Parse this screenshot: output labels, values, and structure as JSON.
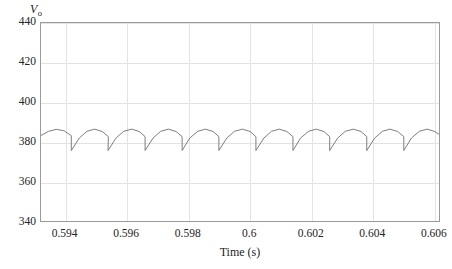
{
  "chart_data": {
    "type": "line",
    "title": "",
    "subtitle": "",
    "xlabel": "Time (s)",
    "ylabel": "V",
    "ylabel_subscript": "o",
    "ylabel_full": "Vo",
    "xlim": [
      0.5932,
      0.6062
    ],
    "ylim": [
      340,
      440
    ],
    "xticks": [
      0.594,
      0.596,
      0.598,
      0.6,
      0.602,
      0.604,
      0.606
    ],
    "xtick_labels": [
      "0.594",
      "0.596",
      "0.598",
      "0.6",
      "0.602",
      "0.604",
      "0.606"
    ],
    "yticks": [
      340,
      360,
      380,
      400,
      420,
      440
    ],
    "ytick_labels": [
      "340",
      "360",
      "380",
      "400",
      "420",
      "440"
    ],
    "grid": true,
    "legend": null,
    "annotations": [],
    "series": [
      {
        "name": "Vo",
        "color": "#6f6f6f",
        "linewidth": 0.9,
        "description": "Rectifier output voltage ripple: repeating arch-shaped cycles with sharp drop at end of each cycle",
        "ripple_period": 0.001206,
        "ripple_peak": 386.4,
        "ripple_trough": 375.6,
        "cycle_count": 11,
        "first_trough_x": 0.59419,
        "x": [
          0.5932,
          0.59345,
          0.5937,
          0.59395,
          0.59419,
          0.59419,
          0.59445,
          0.5947,
          0.59495,
          0.5952,
          0.5954,
          0.59539,
          0.59565,
          0.5959,
          0.59616,
          0.59641,
          0.5966,
          0.5966,
          0.59686,
          0.59711,
          0.59736,
          0.59761,
          0.59781,
          0.59781,
          0.59806,
          0.59832,
          0.59857,
          0.59882,
          0.59901,
          0.59901,
          0.59927,
          0.59952,
          0.59978,
          0.60003,
          0.60022,
          0.60022,
          0.60048,
          0.60073,
          0.60098,
          0.60123,
          0.60143,
          0.60143,
          0.60168,
          0.60194,
          0.60219,
          0.60244,
          0.60263,
          0.60263,
          0.60289,
          0.60314,
          0.6034,
          0.60365,
          0.60384,
          0.60384,
          0.6041,
          0.60435,
          0.6046,
          0.60485,
          0.60505,
          0.60505,
          0.6053,
          0.60556,
          0.60581,
          0.60606,
          0.6062
        ],
        "y": [
          383.2,
          385.3,
          386.3,
          385.6,
          383.1,
          375.6,
          381.9,
          385.3,
          386.4,
          385.2,
          382.6,
          375.6,
          381.9,
          385.3,
          386.4,
          385.2,
          382.6,
          375.6,
          381.9,
          385.3,
          386.4,
          385.2,
          382.6,
          375.6,
          381.9,
          385.3,
          386.4,
          385.2,
          382.6,
          375.6,
          381.9,
          385.3,
          386.4,
          385.2,
          382.6,
          375.6,
          381.9,
          385.3,
          386.4,
          385.2,
          382.6,
          375.6,
          381.9,
          385.3,
          386.4,
          385.2,
          382.6,
          375.6,
          381.9,
          385.3,
          386.4,
          385.2,
          382.6,
          375.6,
          381.9,
          385.3,
          386.4,
          385.2,
          382.6,
          375.6,
          381.9,
          385.3,
          386.4,
          385.2,
          383.8
        ]
      }
    ],
    "colors": {
      "background": "#ffffff",
      "axis": "#9a9a9a",
      "grid": "#e3e3e3",
      "trace": "#6f6f6f",
      "text": "#232323"
    }
  }
}
